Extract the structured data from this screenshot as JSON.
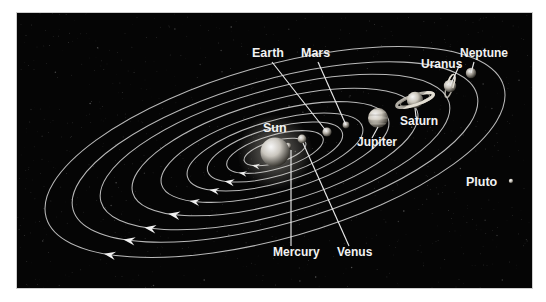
{
  "figure": {
    "kind": "solar-system-diagram",
    "panel": {
      "bg_color": "#050505",
      "border_color": "#ffffff",
      "x": 17,
      "y": 13,
      "width": 515,
      "height": 275
    },
    "label_color": "#f2f2f2",
    "orbit_color": "#b9b9b9",
    "leader_color": "#e8e8e8"
  },
  "labels": {
    "sun": "Sun",
    "mercury": "Mercury",
    "venus": "Venus",
    "earth": "Earth",
    "mars": "Mars",
    "jupiter": "Jupiter",
    "saturn": "Saturn",
    "uranus": "Uranus",
    "neptune": "Neptune",
    "pluto": "Pluto"
  },
  "bodies": [
    {
      "name": "sun",
      "label": "Sun",
      "cx": 275,
      "cy": 152,
      "r": 14.5,
      "color": "#c9c5bd",
      "has_rings": false
    },
    {
      "name": "mercury",
      "label": "Mercury",
      "cx": 288,
      "cy": 146,
      "r": 3.2,
      "color": "#b5b0a8",
      "has_rings": false
    },
    {
      "name": "venus",
      "label": "Venus",
      "cx": 302,
      "cy": 139,
      "r": 4.4,
      "color": "#bdb8ae",
      "has_rings": false
    },
    {
      "name": "earth",
      "label": "Earth",
      "cx": 327,
      "cy": 132,
      "r": 4.6,
      "color": "#b9b4ab",
      "has_rings": false
    },
    {
      "name": "mars",
      "label": "Mars",
      "cx": 346,
      "cy": 125,
      "r": 3.4,
      "color": "#aaa59c",
      "has_rings": false
    },
    {
      "name": "jupiter",
      "label": "Jupiter",
      "cx": 378,
      "cy": 118,
      "r": 10.0,
      "color": "#cbc6bb",
      "has_rings": false
    },
    {
      "name": "saturn",
      "label": "Saturn",
      "cx": 415,
      "cy": 100,
      "r": 8.2,
      "color": "#cac5ba",
      "has_rings": true
    },
    {
      "name": "uranus",
      "label": "Uranus",
      "cx": 450,
      "cy": 86,
      "r": 6.2,
      "color": "#c4bfb5",
      "has_rings": true
    },
    {
      "name": "neptune",
      "label": "Neptune",
      "cx": 471,
      "cy": 73,
      "r": 5.2,
      "color": "#a9a49b",
      "has_rings": false
    },
    {
      "name": "pluto",
      "label": "Pluto",
      "cx": 511,
      "cy": 181,
      "r": 2.2,
      "color": "#d0cbc2",
      "has_rings": false
    }
  ],
  "orbits": [
    {
      "for": "mercury",
      "rx": 32,
      "ry": 11
    },
    {
      "for": "venus",
      "rx": 50,
      "ry": 17
    },
    {
      "for": "earth",
      "rx": 70,
      "ry": 24
    },
    {
      "for": "mars",
      "rx": 91,
      "ry": 31
    },
    {
      "for": "jupiter",
      "rx": 118,
      "ry": 40
    },
    {
      "for": "saturn",
      "rx": 148,
      "ry": 51
    },
    {
      "for": "uranus",
      "rx": 181,
      "ry": 62
    },
    {
      "for": "neptune",
      "rx": 210,
      "ry": 72
    },
    {
      "for": "pluto",
      "rx": 238,
      "ry": 86
    }
  ],
  "label_placements": [
    {
      "for": "earth",
      "x": 252,
      "y": 57,
      "anchor": "start"
    },
    {
      "for": "mars",
      "x": 301,
      "y": 57,
      "anchor": "start"
    },
    {
      "for": "uranus",
      "x": 421,
      "y": 68,
      "anchor": "start"
    },
    {
      "for": "neptune",
      "x": 460,
      "y": 57,
      "anchor": "start"
    },
    {
      "for": "sun",
      "x": 263,
      "y": 132,
      "anchor": "start"
    },
    {
      "for": "jupiter",
      "x": 357,
      "y": 146,
      "anchor": "start"
    },
    {
      "for": "saturn",
      "x": 400,
      "y": 125,
      "anchor": "start"
    },
    {
      "for": "pluto",
      "x": 466,
      "y": 186,
      "anchor": "start"
    },
    {
      "for": "mercury",
      "x": 273,
      "y": 256,
      "anchor": "start"
    },
    {
      "for": "venus",
      "x": 337,
      "y": 256,
      "anchor": "start"
    }
  ],
  "orbit_direction": "counterclockwise"
}
